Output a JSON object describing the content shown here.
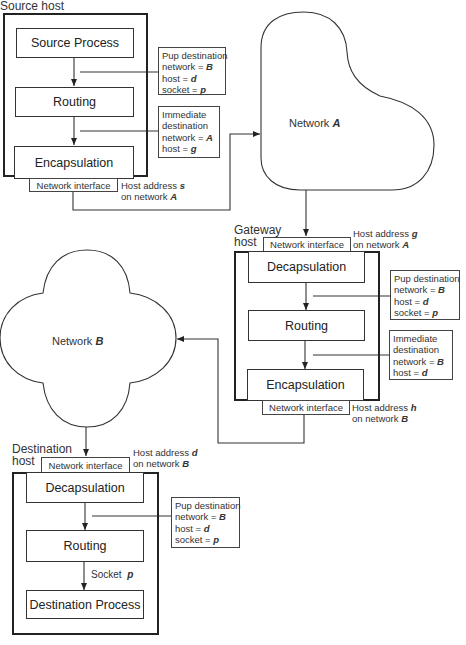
{
  "source_host": {
    "title": "Source host",
    "blocks": [
      "Source Process",
      "Routing",
      "Encapsulation"
    ],
    "network_interface": "Network interface",
    "address": {
      "line1": "Host address",
      "var1": "s",
      "line2": "on network",
      "var2": "A"
    },
    "notes": [
      {
        "title": "Pup destination",
        "rows": [
          {
            "k": "network =",
            "v": "B"
          },
          {
            "k": "host =",
            "v": "d"
          },
          {
            "k": "socket =",
            "v": "p"
          }
        ]
      },
      {
        "title": "Immediate",
        "title2": "destination",
        "rows": [
          {
            "k": "network =",
            "v": "A"
          },
          {
            "k": "host =",
            "v": "g"
          }
        ]
      }
    ]
  },
  "network_a": {
    "label": "Network",
    "var": "A"
  },
  "gateway_host": {
    "title1": "Gateway",
    "title2": "host",
    "network_interface_in": "Network interface",
    "address_in": {
      "line1": "Host address",
      "var1": "g",
      "line2": "on network",
      "var2": "A"
    },
    "blocks": [
      "Decapsulation",
      "Routing",
      "Encapsulation"
    ],
    "network_interface_out": "Network interface",
    "address_out": {
      "line1": "Host address",
      "var1": "h",
      "line2": "on network",
      "var2": "B"
    },
    "notes": [
      {
        "title": "Pup destination",
        "rows": [
          {
            "k": "network =",
            "v": "B"
          },
          {
            "k": "host =",
            "v": "d"
          },
          {
            "k": "socket =",
            "v": "p"
          }
        ]
      },
      {
        "title": "Immediate",
        "title2": "destination",
        "rows": [
          {
            "k": "network =",
            "v": "B"
          },
          {
            "k": "host =",
            "v": "d"
          }
        ]
      }
    ]
  },
  "network_b": {
    "label": "Network",
    "var": "B"
  },
  "destination_host": {
    "title1": "Destination",
    "title2": "host",
    "network_interface": "Network interface",
    "address": {
      "line1": "Host address",
      "var1": "d",
      "line2": "on network",
      "var2": "B"
    },
    "blocks": [
      "Decapsulation",
      "Routing",
      "Destination Process"
    ],
    "socket_label": "Socket",
    "socket_var": "p",
    "notes": [
      {
        "title": "Pup destination",
        "rows": [
          {
            "k": "network =",
            "v": "B"
          },
          {
            "k": "host =",
            "v": "d"
          },
          {
            "k": "socket =",
            "v": "p"
          }
        ]
      }
    ]
  }
}
